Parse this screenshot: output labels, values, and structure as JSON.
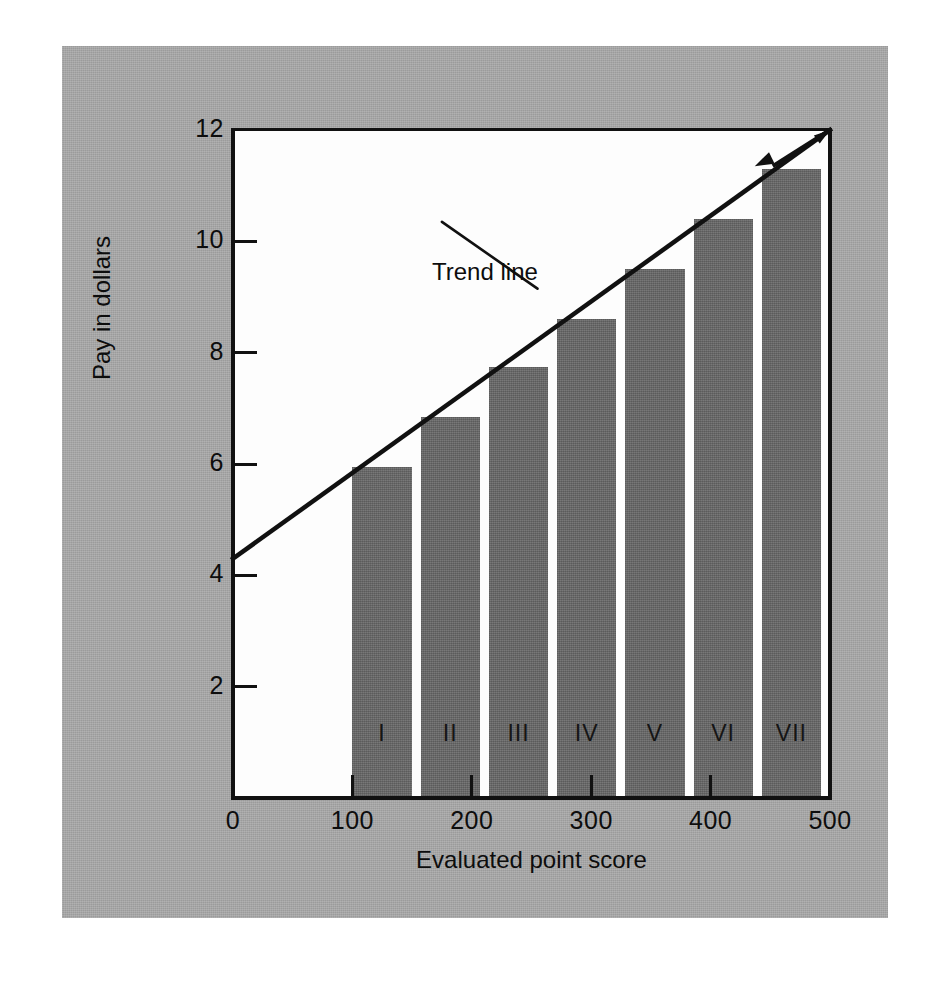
{
  "figure": {
    "background": "#ffffff",
    "matte_color": "#9b9b9b",
    "plot_background": "#fdfdfd",
    "bar_color": "#6e6e6e",
    "ink_color": "#111111"
  },
  "chart_data": {
    "type": "bar",
    "title": "",
    "xlabel": "Evaluated point score",
    "ylabel": "Pay in dollars",
    "categories": [
      "I",
      "II",
      "III",
      "IV",
      "V",
      "VI",
      "VII"
    ],
    "category_points": [
      100,
      150,
      200,
      250,
      300,
      350,
      400
    ],
    "values": [
      5.95,
      6.85,
      7.75,
      8.6,
      9.5,
      10.4,
      11.3
    ],
    "xlim": [
      0,
      500
    ],
    "ylim": [
      0,
      12
    ],
    "xticks": [
      0,
      100,
      200,
      300,
      400,
      500
    ],
    "xtick_labels": [
      "0",
      "100",
      "200",
      "300",
      "400",
      "500"
    ],
    "yticks": [
      2,
      4,
      6,
      8,
      10,
      12
    ],
    "ytick_labels": [
      "2",
      "4",
      "6",
      "8",
      "10",
      "12"
    ],
    "grid": false,
    "legend": false,
    "annotations": [
      {
        "name": "trend-line",
        "label": "Trend line",
        "type": "line",
        "x0": 0,
        "y0": 4.3,
        "x1": 500,
        "y1": 12.0
      },
      {
        "name": "trend-line-leader",
        "label": "",
        "type": "leader",
        "from_x": 255,
        "from_y": 9.15,
        "to_x": 175,
        "to_y": 10.35
      },
      {
        "name": "last-bar-callout",
        "label": "",
        "type": "leader-arrow",
        "from_x": 500,
        "from_y": 12.0,
        "to_x": 437,
        "to_y": 11.35
      }
    ]
  },
  "labels": {
    "ylabel": "Pay in dollars",
    "xlabel": "Evaluated point score",
    "trend_line": "Trend line"
  }
}
